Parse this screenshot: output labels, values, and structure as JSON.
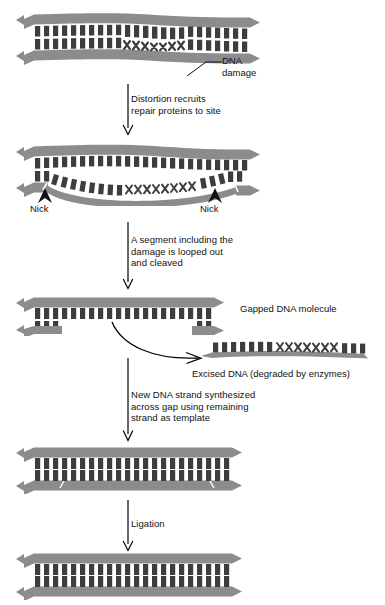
{
  "figure": {
    "background_color": "#ffffff",
    "backbone_color": "#8c8c8c",
    "backbone_shadow_color": "#b5b5b5",
    "base_color": "#3d3d3d",
    "text_color": "#111111",
    "arrow_color": "#000000"
  },
  "stages": [
    {
      "id": "stage-damaged-dna",
      "name": "damaged-dna",
      "description": "Double-stranded DNA with a distortion caused by damaged bases"
    },
    {
      "id": "stage-nicked-dna",
      "name": "nicked-dna",
      "description": "Repair proteins nick the damaged strand on both sides of the lesion and the segment loops out"
    },
    {
      "id": "stage-gapped-dna",
      "name": "gapped-dna",
      "description": "Gapped DNA molecule after the damaged segment is excised"
    },
    {
      "id": "stage-excised-fragment",
      "name": "excised-fragment",
      "description": "Released single-stranded fragment carrying the damaged bases"
    },
    {
      "id": "stage-resynthesized-dna",
      "name": "resynthesized-dna",
      "description": "New DNA strand synthesized across the gap, nicks still present"
    },
    {
      "id": "stage-repaired-dna",
      "name": "repaired-dna",
      "description": "Fully repaired and ligated DNA duplex"
    }
  ],
  "step_captions": [
    {
      "id": "step-1",
      "text": "Distortion recruits\nrepair proteins to site"
    },
    {
      "id": "step-2",
      "text": "A segment including the\ndamage is looped out\nand cleaved"
    },
    {
      "id": "step-3",
      "text": "New DNA strand synthesized\nacross gap using remaining\nstrand as template"
    },
    {
      "id": "step-4",
      "text": "Ligation"
    }
  ],
  "annotations": {
    "dna_damage": "DNA\ndamage",
    "nick_left": "Nick",
    "nick_right": "Nick",
    "gapped_dna": "Gapped DNA molecule",
    "excised_dna": "Excised DNA (degraded by enzymes)"
  }
}
